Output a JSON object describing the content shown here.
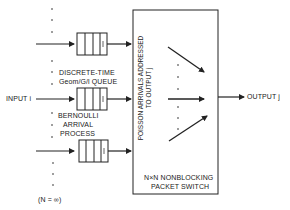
{
  "diagram": {
    "labels": {
      "queue_type_line1": "DISCRETE-TIME",
      "queue_type_line2": "Geom/G/l QUEUE",
      "input": "INPUT i",
      "arrival_line1": "BERNOULLI",
      "arrival_line2": "ARRIVAL",
      "arrival_line3": "PROCESS",
      "n_value": "(N  =  ∞)",
      "poisson_line1": "POISSON ARRIVALS ADDRESSED",
      "poisson_line2": "TO OUTPUT j",
      "switch_line1": "N×N NONBLOCKING",
      "switch_line2": "PACKET SWITCH",
      "output": "OUTPUT j",
      "queue_server": "j"
    },
    "colors": {
      "line": "#222222",
      "background": "#ffffff"
    }
  }
}
